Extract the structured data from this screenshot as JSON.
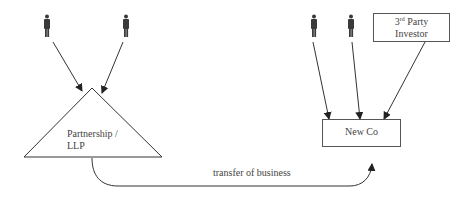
{
  "diagram": {
    "title": "",
    "people": [
      {
        "id": "person-1",
        "group": "partnership"
      },
      {
        "id": "person-2",
        "group": "partnership"
      },
      {
        "id": "person-3",
        "group": "newco"
      },
      {
        "id": "person-4",
        "group": "newco"
      }
    ],
    "nodes": {
      "partnership": {
        "label_line1": "Partnership /",
        "label_line2": "LLP",
        "shape": "triangle"
      },
      "third_party": {
        "label_sup_num": "3",
        "label_sup": "rd",
        "label_line1_rest": " Party",
        "label_line2": "Investor",
        "shape": "rectangle"
      },
      "newco": {
        "label": "New Co",
        "shape": "rectangle"
      }
    },
    "edges": [
      {
        "from": "person-1",
        "to": "partnership"
      },
      {
        "from": "person-2",
        "to": "partnership"
      },
      {
        "from": "person-3",
        "to": "newco"
      },
      {
        "from": "person-4",
        "to": "newco"
      },
      {
        "from": "third_party",
        "to": "newco"
      },
      {
        "from": "partnership",
        "to": "newco",
        "label": "transfer of business"
      }
    ],
    "transfer_label": "transfer of business",
    "colors": {
      "line": "#333333",
      "icon": "#3a3a3a",
      "text": "#444444"
    }
  }
}
